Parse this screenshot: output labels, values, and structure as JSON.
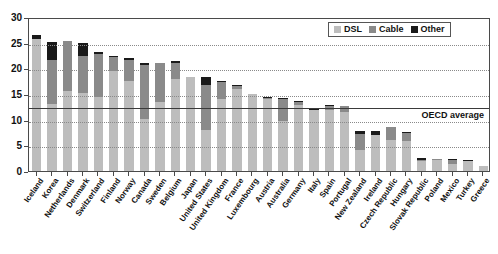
{
  "chart_data": {
    "type": "bar",
    "title": "",
    "xlabel": "",
    "ylabel": "",
    "ylim": [
      0,
      30
    ],
    "yticks": [
      0,
      5,
      10,
      15,
      20,
      25,
      30
    ],
    "grid": true,
    "stacked": true,
    "legend_position": "top-right",
    "legend": [
      "DSL",
      "Cable",
      "Other"
    ],
    "colors": {
      "DSL": "#bdbdbd",
      "Cable": "#8a8a8a",
      "Other": "#1a1a1a",
      "axis": "#4a4a4a",
      "grid": "#8a8a8a",
      "oecd_line": "#3a3a3a"
    },
    "annotations": [
      {
        "name": "oecd-average",
        "label": "OECD average",
        "value": 12.7
      }
    ],
    "categories": [
      "Iceland",
      "Korea",
      "Netherlands",
      "Denmark",
      "Switzerland",
      "Finland",
      "Norway",
      "Canada",
      "Sweden",
      "Belgium",
      "Japan",
      "United States",
      "United Kingdom",
      "France",
      "Luxembourg",
      "Austria",
      "Australia",
      "Germany",
      "Italy",
      "Spain",
      "Portugal",
      "New Zealand",
      "Ireland",
      "Czech Republic",
      "Hungary",
      "Slovak Republic",
      "Poland",
      "Mexico",
      "Turkey",
      "Greece"
    ],
    "series": [
      {
        "name": "DSL",
        "values": [
          25.8,
          13.0,
          15.6,
          15.2,
          14.5,
          19.5,
          17.5,
          10.2,
          13.4,
          17.9,
          18.4,
          8.0,
          14.0,
          16.0,
          15.1,
          14.0,
          9.8,
          12.8,
          11.9,
          11.8,
          11.4,
          4.0,
          7.1,
          6.0,
          5.9,
          1.9,
          2.1,
          1.3,
          1.9,
          1.0
        ]
      },
      {
        "name": "Cable",
        "values": [
          0.0,
          8.7,
          9.7,
          7.3,
          8.3,
          2.7,
          4.1,
          10.5,
          7.6,
          3.1,
          0.0,
          8.7,
          3.4,
          0.6,
          0.0,
          0.2,
          4.2,
          0.6,
          0.0,
          0.9,
          1.3,
          3.3,
          0.0,
          2.5,
          1.5,
          0.2,
          0.2,
          0.8,
          0.0,
          0.0
        ]
      },
      {
        "name": "Other",
        "values": [
          0.7,
          3.4,
          0.0,
          2.5,
          0.3,
          0.2,
          0.4,
          0.4,
          0.0,
          0.4,
          0.0,
          1.7,
          0.1,
          0.2,
          0.0,
          0.2,
          0.2,
          0.1,
          0.2,
          0.1,
          0.0,
          0.4,
          0.6,
          0.0,
          0.2,
          0.4,
          0.0,
          0.1,
          0.2,
          0.0
        ]
      }
    ],
    "totals": [
      26.5,
      25.1,
      25.3,
      25.0,
      23.1,
      22.4,
      22.0,
      21.1,
      21.0,
      21.4,
      18.4,
      18.4,
      17.5,
      16.8,
      15.1,
      14.4,
      14.2,
      13.5,
      12.1,
      12.8,
      12.7,
      7.7,
      7.7,
      8.5,
      7.6,
      2.5,
      2.3,
      2.2,
      2.1,
      1.0
    ]
  }
}
